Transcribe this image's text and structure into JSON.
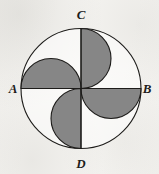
{
  "figure": {
    "background_color": "#f6f5f2",
    "shading_color": "#808080",
    "stroke_color": "#1d1c1a",
    "stroke_width": 1.1,
    "circle": {
      "center_x": 81,
      "center_y": 88.5,
      "radius": 60
    },
    "semicircle_radius": 30,
    "labels": {
      "a": "A",
      "b": "B",
      "c": "C",
      "d": "D"
    },
    "label_positions": {
      "a": {
        "x": 13,
        "y": 93
      },
      "b": {
        "x": 146,
        "y": 93
      },
      "c": {
        "x": 81,
        "y": 19
      },
      "d": {
        "x": 81,
        "y": 168
      }
    },
    "diameters": [
      {
        "name": "AB",
        "x1": 21,
        "y1": 88.5,
        "x2": 141,
        "y2": 88.5
      },
      {
        "name": "CD",
        "x1": 81,
        "y1": 28.5,
        "x2": 81,
        "y2": 148.5
      }
    ],
    "shaded_regions": [
      {
        "name": "upper-right-semicircle",
        "on_radius": "OC",
        "bulge": "right",
        "path": "M 81 28.5 A 30 30 0 0 1 81 88.5 Z"
      },
      {
        "name": "upper-left-semicircle",
        "on_radius": "OA",
        "bulge": "up",
        "path": "M 21 88.5 A 30 30 0 0 1 81 88.5 Z"
      },
      {
        "name": "lower-left-semicircle",
        "on_radius": "OD",
        "bulge": "left",
        "path": "M 81 148.5 A 30 30 0 0 1 81 88.5 Z"
      },
      {
        "name": "lower-right-semicircle",
        "on_radius": "OB",
        "bulge": "down",
        "path": "M 141 88.5 A 30 30 0 0 1 81 88.5 Z"
      }
    ]
  }
}
